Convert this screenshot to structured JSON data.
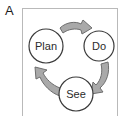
{
  "figure": {
    "panel_label": "A",
    "title": "",
    "box": {
      "border_color": "#b9b9b9",
      "background_color": "#ffffff"
    }
  },
  "diagram": {
    "type": "cycle",
    "direction": "clockwise",
    "node_outline_color": "#3a3a3a",
    "node_fill_color": "#ffffff",
    "node_text_color": "#2b2b2b",
    "arrow_fill_color": "#a9a9a9",
    "arrow_outline_color": "#6e6e6e",
    "nodes": [
      {
        "id": "plan",
        "label": "Plan",
        "cx": 24,
        "cy": 38,
        "r": 17
      },
      {
        "id": "do",
        "label": "Do",
        "cx": 77,
        "cy": 38,
        "r": 15
      },
      {
        "id": "see",
        "label": "See",
        "cx": 54,
        "cy": 86,
        "r": 17
      }
    ],
    "arrows": [
      {
        "id": "plan-to-do",
        "from": "plan",
        "to": "do",
        "label": ""
      },
      {
        "id": "do-to-see",
        "from": "do",
        "to": "see",
        "label": ""
      },
      {
        "id": "see-to-plan",
        "from": "see",
        "to": "plan",
        "label": ""
      }
    ]
  }
}
